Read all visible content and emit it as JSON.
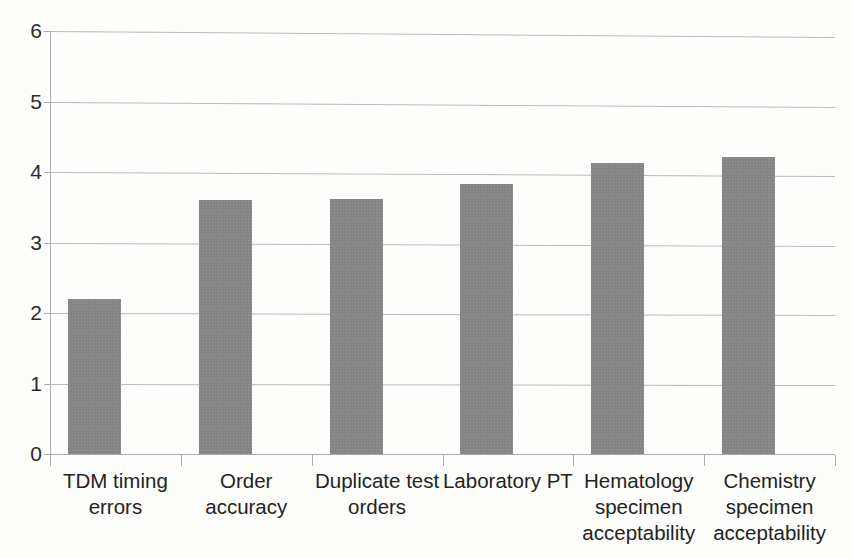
{
  "chart_data": {
    "type": "bar",
    "title": "",
    "subtitle": "",
    "xlabel": "",
    "ylabel": "",
    "categories": [
      "TDM timing\nerrors",
      "Order\naccuracy",
      "Duplicate test\norders",
      "Laboratory PT",
      "Hematology\nspecimen\nacceptability",
      "Chemistry\nspecimen\nacceptability"
    ],
    "values": [
      2.2,
      3.6,
      3.62,
      3.83,
      4.13,
      4.22
    ],
    "ylim": [
      0,
      6
    ],
    "y_ticks": [
      0,
      1,
      2,
      3,
      4,
      5,
      6
    ],
    "y_tick_labels": [
      "0",
      "1",
      "2",
      "3",
      "4",
      "5",
      "6"
    ],
    "grid": true,
    "grid_axis": "y",
    "legend": false,
    "legend_position": "none",
    "series": [
      {
        "name": "",
        "values": [
          2.2,
          3.6,
          3.62,
          3.83,
          4.13,
          4.22
        ],
        "color": "#858585"
      }
    ],
    "colors": {
      "bar_fill": "#858585",
      "gridline": "#b9b9b9",
      "axis": "#b0b0b0",
      "text": "#232323",
      "background": "#fdfdfc"
    }
  }
}
